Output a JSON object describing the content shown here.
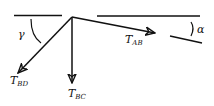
{
  "diagram": {
    "type": "force-diagram",
    "colors": {
      "stroke": "#111111",
      "background": "#ffffff"
    },
    "labels": {
      "gamma": "γ",
      "alpha": "α",
      "t_ab_main": "T",
      "t_ab_sub": "AB",
      "t_bd_main": "T",
      "t_bd_sub": "BD",
      "t_bc_main": "T",
      "t_bc_sub": "BC"
    },
    "forces": [
      {
        "name": "T_AB",
        "direction": "right, slightly downward (angle α below horizontal)"
      },
      {
        "name": "T_BD",
        "direction": "down-left (angle γ from horizontal)"
      },
      {
        "name": "T_BC",
        "direction": "vertically downward"
      }
    ],
    "angles": [
      {
        "name": "γ",
        "between": "left horizontal reference and T_BD"
      },
      {
        "name": "α",
        "between": "horizontal reference and T_AB direction"
      }
    ]
  }
}
